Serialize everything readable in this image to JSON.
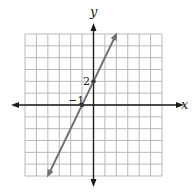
{
  "chart_data": {
    "type": "line",
    "title": "",
    "xlabel": "x",
    "ylabel": "y",
    "xlim": [
      -6,
      6
    ],
    "ylim": [
      -6,
      6
    ],
    "grid": true,
    "grid_step": 1,
    "legend": null,
    "series": [
      {
        "name": "y = 2x + 2",
        "slope": 2,
        "intercept": 2,
        "x": [
          -3.95,
          -1,
          0,
          1.95
        ],
        "y": [
          -5.9,
          0,
          2,
          5.9
        ],
        "arrows_both_ends": true
      }
    ],
    "marked_points": [
      {
        "x": -1,
        "y": 0,
        "label": "−1"
      },
      {
        "x": 0,
        "y": 2,
        "label": "2"
      }
    ],
    "annotations": [
      "−1",
      "2"
    ]
  },
  "colors": {
    "grid": "#b9b9b9",
    "axis": "#1a1a1a",
    "line": "#6f6f6f",
    "point": "#3a3a3a"
  },
  "labels": {
    "x_axis": "x",
    "y_axis": "y",
    "x_intercept": "−1",
    "y_intercept": "2"
  }
}
